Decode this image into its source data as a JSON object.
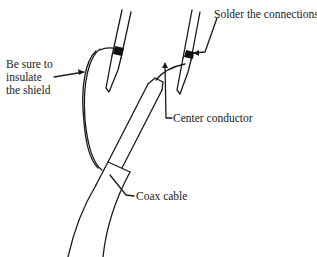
{
  "diagram": {
    "type": "soldering-coax-illustration",
    "labels": {
      "shield_note_line1": "Be sure to",
      "shield_note_line2": "insulate",
      "shield_note_line3": "the shield",
      "solder": "Solder the connections",
      "center": "Center conductor",
      "coax": "Coax cable"
    },
    "colors": {
      "stroke": "#1a1a1a",
      "solder_blob": "#111111",
      "background": "#ffffff"
    }
  }
}
